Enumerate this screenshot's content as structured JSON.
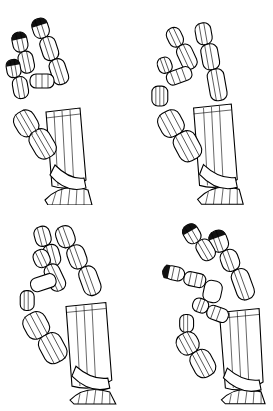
{
  "figure": {
    "background": "#ffffff",
    "line_color": "#000000",
    "panels": [
      {
        "id": "top-left",
        "pose": "fingers extended, slight curl"
      },
      {
        "id": "top-right",
        "pose": "fingers spread, index and thumb curling"
      },
      {
        "id": "bottom-left",
        "pose": "fingers bending toward thumb"
      },
      {
        "id": "bottom-right",
        "pose": "precision pinch with thumb and index"
      }
    ]
  }
}
